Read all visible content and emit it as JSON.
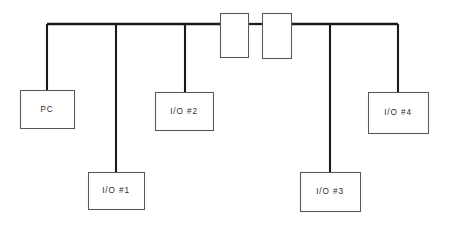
{
  "diagram": {
    "background_color": "#ffffff",
    "line_color": "#1a1a1a",
    "box_stroke_color": "#58585a",
    "box_fill_color": "#ffffff",
    "text_color": "#2b2b2b",
    "nodes": [
      {
        "id": "pc",
        "label": "PC",
        "x": 20,
        "y": 90,
        "w": 54,
        "h": 38,
        "drop_x": 47,
        "drop_from_y": 24,
        "drop_to_y": 90
      },
      {
        "id": "io1",
        "label": "I/O #1",
        "x": 88,
        "y": 172,
        "w": 56,
        "h": 37,
        "drop_x": 116,
        "drop_from_y": 24,
        "drop_to_y": 172
      },
      {
        "id": "io2",
        "label": "I/O #2",
        "x": 155,
        "y": 92,
        "w": 58,
        "h": 38,
        "drop_x": 185,
        "drop_from_y": 24,
        "drop_to_y": 92
      },
      {
        "id": "io3",
        "label": "I/O #3",
        "x": 300,
        "y": 172,
        "w": 60,
        "h": 39,
        "drop_x": 330,
        "drop_from_y": 24,
        "drop_to_y": 172
      },
      {
        "id": "io4",
        "label": "I/O #4",
        "x": 368,
        "y": 92,
        "w": 60,
        "h": 41,
        "drop_x": 398,
        "drop_from_y": 24,
        "drop_to_y": 92
      }
    ],
    "connectors": [
      {
        "id": "connector-left",
        "label": "",
        "x": 220,
        "y": 13,
        "w": 28,
        "h": 44
      },
      {
        "id": "connector-right",
        "label": "",
        "x": 262,
        "y": 13,
        "w": 29,
        "h": 45
      }
    ],
    "bus_segments": [
      {
        "id": "bus-left",
        "x1": 47,
        "y1": 24,
        "x2": 220,
        "y2": 24
      },
      {
        "id": "bus-right",
        "x1": 291,
        "y1": 24,
        "x2": 398,
        "y2": 24
      }
    ],
    "connector_stubs": [
      {
        "id": "stub-left-out",
        "x1": 248,
        "y1": 24,
        "x2": 256,
        "y2": 24
      },
      {
        "id": "stub-right-in",
        "x1": 254,
        "y1": 24,
        "x2": 262,
        "y2": 24
      }
    ],
    "gap": {
      "id": "bus-gap",
      "from_x": 256,
      "to_x": 254,
      "y": 24
    }
  }
}
